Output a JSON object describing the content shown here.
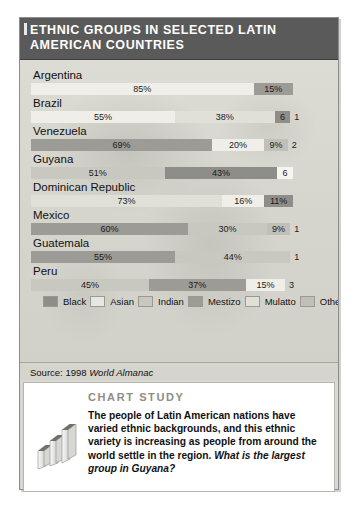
{
  "figure": {
    "title": "Ethnic Groups in Selected Latin American Countries",
    "source_prefix": "Source: 1998 ",
    "source_italic": "World Almanac"
  },
  "chart_data": {
    "type": "bar",
    "subtype": "stacked-horizontal-100",
    "title": "Ethnic Groups in Selected Latin American Countries",
    "xlabel": "",
    "ylabel": "",
    "xlim": [
      0,
      100
    ],
    "grid": false,
    "legend_position": "bottom",
    "source": "1998 World Almanac",
    "categories": [
      "Argentina",
      "Brazil",
      "Venezuela",
      "Guyana",
      "Dominican Republic",
      "Mexico",
      "Guatemala",
      "Peru"
    ],
    "series": [
      {
        "name": "Black",
        "key": "black",
        "values": [
          0,
          6,
          0,
          43,
          11,
          0,
          0,
          0
        ]
      },
      {
        "name": "Asian",
        "key": "asian",
        "values": [
          0,
          0,
          0,
          0,
          0,
          0,
          0,
          0
        ]
      },
      {
        "name": "Indian",
        "key": "indian",
        "values": [
          0,
          0,
          0,
          51,
          0,
          30,
          44,
          45
        ]
      },
      {
        "name": "Mestizo",
        "key": "mestizo",
        "values": [
          15,
          0,
          69,
          0,
          0,
          60,
          55,
          37
        ]
      },
      {
        "name": "Mulatto",
        "key": "mulatto",
        "values": [
          0,
          38,
          0,
          0,
          73,
          0,
          0,
          0
        ]
      },
      {
        "name": "Other",
        "key": "other",
        "values": [
          0,
          0,
          9,
          0,
          0,
          9,
          0,
          0
        ]
      },
      {
        "name": "European",
        "key": "european",
        "values": [
          85,
          55,
          20,
          0,
          16,
          0,
          0,
          15
        ]
      },
      {
        "name": "Mixed",
        "key": "mixed",
        "values": [
          0,
          1,
          2,
          6,
          0,
          1,
          1,
          3
        ]
      }
    ],
    "rows": [
      {
        "country": "Argentina",
        "segments": [
          {
            "group": "European",
            "key": "european",
            "label": "85%",
            "value": 85,
            "outside": false
          },
          {
            "group": "Mestizo",
            "key": "mestizo",
            "label": "15%",
            "value": 15,
            "outside": false
          }
        ]
      },
      {
        "country": "Brazil",
        "segments": [
          {
            "group": "European",
            "key": "european",
            "label": "55%",
            "value": 55,
            "outside": false
          },
          {
            "group": "Mulatto",
            "key": "mulatto",
            "label": "38%",
            "value": 38,
            "outside": false
          },
          {
            "group": "Black",
            "key": "black",
            "label": "6",
            "value": 6,
            "outside": false
          },
          {
            "group": "Mixed",
            "key": "mixed",
            "label": "1",
            "value": 1,
            "outside": true
          }
        ]
      },
      {
        "country": "Venezuela",
        "segments": [
          {
            "group": "Mestizo",
            "key": "mestizo",
            "label": "69%",
            "value": 69,
            "outside": false
          },
          {
            "group": "European",
            "key": "european",
            "label": "20%",
            "value": 20,
            "outside": false
          },
          {
            "group": "Other",
            "key": "other",
            "label": "9%",
            "value": 9,
            "outside": false
          },
          {
            "group": "Mixed",
            "key": "mixed",
            "label": "2",
            "value": 2,
            "outside": true
          }
        ]
      },
      {
        "country": "Guyana",
        "segments": [
          {
            "group": "Indian",
            "key": "indian",
            "label": "51%",
            "value": 51,
            "outside": false
          },
          {
            "group": "Black",
            "key": "black",
            "label": "43%",
            "value": 43,
            "outside": false
          },
          {
            "group": "Mixed",
            "key": "mixed",
            "label": "6",
            "value": 6,
            "outside": false
          }
        ]
      },
      {
        "country": "Dominican Republic",
        "segments": [
          {
            "group": "Mulatto",
            "key": "mulatto",
            "label": "73%",
            "value": 73,
            "outside": false
          },
          {
            "group": "European",
            "key": "european",
            "label": "16%",
            "value": 16,
            "outside": false
          },
          {
            "group": "Black",
            "key": "black",
            "label": "11%",
            "value": 11,
            "outside": false
          }
        ]
      },
      {
        "country": "Mexico",
        "segments": [
          {
            "group": "Mestizo",
            "key": "mestizo",
            "label": "60%",
            "value": 60,
            "outside": false
          },
          {
            "group": "Indian",
            "key": "indian",
            "label": "30%",
            "value": 30,
            "outside": false
          },
          {
            "group": "Other",
            "key": "other",
            "label": "9%",
            "value": 9,
            "outside": false
          },
          {
            "group": "Mixed",
            "key": "mixed",
            "label": "1",
            "value": 1,
            "outside": true
          }
        ]
      },
      {
        "country": "Guatemala",
        "segments": [
          {
            "group": "Mestizo",
            "key": "mestizo",
            "label": "55%",
            "value": 55,
            "outside": false
          },
          {
            "group": "Indian",
            "key": "indian",
            "label": "44%",
            "value": 44,
            "outside": false
          },
          {
            "group": "Mixed",
            "key": "mixed",
            "label": "1",
            "value": 1,
            "outside": true
          }
        ]
      },
      {
        "country": "Peru",
        "segments": [
          {
            "group": "Indian",
            "key": "indian",
            "label": "45%",
            "value": 45,
            "outside": false
          },
          {
            "group": "Mestizo",
            "key": "mestizo",
            "label": "37%",
            "value": 37,
            "outside": false
          },
          {
            "group": "European",
            "key": "european",
            "label": "15%",
            "value": 15,
            "outside": false
          },
          {
            "group": "Mixed",
            "key": "mixed",
            "label": "3",
            "value": 3,
            "outside": true
          }
        ]
      }
    ],
    "legend": [
      {
        "label": "Black",
        "key": "black",
        "color": "#8d8d8a"
      },
      {
        "label": "Asian",
        "key": "asian",
        "color": "#e7e6e0"
      },
      {
        "label": "Indian",
        "key": "indian",
        "color": "#c8c7c0"
      },
      {
        "label": "Mestizo",
        "key": "mestizo",
        "color": "#9c9b95"
      },
      {
        "label": "Mulatto",
        "key": "mulatto",
        "color": "#e0dfd8"
      },
      {
        "label": "Other",
        "key": "other",
        "color": "#c0bfb8"
      },
      {
        "label": "European",
        "key": "european",
        "color": "#efeee9"
      },
      {
        "label": "Mixed",
        "key": "mixed",
        "color": "#f6f5f1"
      }
    ]
  },
  "study": {
    "heading": "Chart Study",
    "body_text": "The people of Latin American nations have varied ethnic backgrounds, and this ethnic variety is increasing as people from around the world settle in the region. ",
    "body_question": "What is the largest group in Guyana?"
  }
}
